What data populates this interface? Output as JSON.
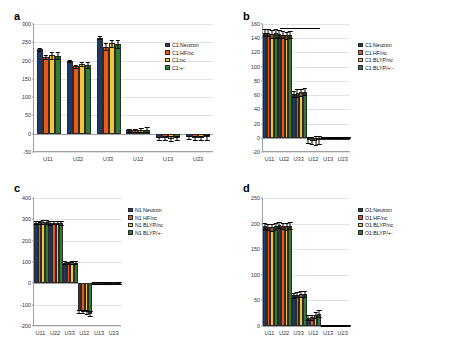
{
  "figure": {
    "background": "#ffffff",
    "series_colors": [
      "#1F3864",
      "#E8591B",
      "#F5C23A",
      "#2E7D32"
    ]
  },
  "panels": [
    {
      "letter": "a",
      "legend": [
        "C1:Neutron",
        "C1:HF/nc",
        "C1:nc",
        "C1:+-"
      ],
      "chart_data": {
        "type": "bar",
        "title": "",
        "xlabel": "",
        "ylabel": "",
        "categories": [
          "U11",
          "U22",
          "U33",
          "U12",
          "U13",
          "U23"
        ],
        "ylim": [
          -50,
          300
        ],
        "yticks": [
          -50,
          0,
          50,
          100,
          150,
          200,
          250,
          300
        ],
        "grid": true,
        "legend_position": "top-right",
        "series": [
          {
            "name": "C1:Neutron",
            "color": "#1F3864",
            "values": [
              231,
              199,
              263,
              9,
              -12,
              -10
            ],
            "errors": [
              4,
              3,
              4,
              3,
              4,
              4
            ]
          },
          {
            "name": "C1:HF/nc",
            "color": "#E8591B",
            "values": [
              210,
              184,
              238,
              10,
              -12,
              -11
            ],
            "errors": [
              5,
              4,
              9,
              4,
              5,
              5
            ]
          },
          {
            "name": "C1:nc",
            "color": "#F5C23A",
            "values": [
              214,
              190,
              247,
              10,
              -14,
              -12
            ],
            "errors": [
              10,
              6,
              10,
              6,
              7,
              6
            ]
          },
          {
            "name": "C1:+-",
            "color": "#2E7D32",
            "values": [
              213,
              188,
              245,
              11,
              -11,
              -10
            ],
            "errors": [
              10,
              7,
              10,
              7,
              6,
              6
            ]
          }
        ]
      }
    },
    {
      "letter": "b",
      "legend": [
        "C1:Neutron",
        "C1:HF/nc",
        "C1:BLYP/nc",
        "C1:BLYP/+ -"
      ],
      "annotation_bar": true,
      "chart_data": {
        "type": "bar",
        "title": "",
        "xlabel": "",
        "ylabel": "",
        "categories": [
          "U11",
          "U22",
          "U33",
          "U12",
          "U13",
          "U23"
        ],
        "ylim": [
          -20,
          160
        ],
        "yticks": [
          -20,
          0,
          20,
          40,
          60,
          80,
          100,
          120,
          140,
          160
        ],
        "grid": true,
        "legend_position": "right",
        "series": [
          {
            "name": "C1:Neutron",
            "color": "#1F3864",
            "values": [
              148,
              146,
              62,
              -3,
              0,
              0
            ],
            "errors": [
              5,
              5,
              4,
              4,
              1,
              1
            ]
          },
          {
            "name": "C1:HF/nc",
            "color": "#E8591B",
            "values": [
              148,
              145,
              63,
              -4,
              0,
              0
            ],
            "errors": [
              5,
              5,
              5,
              5,
              1,
              1
            ]
          },
          {
            "name": "C1:BLYP/nc",
            "color": "#F5C23A",
            "values": [
              146,
              144,
              64,
              -4,
              0,
              0
            ],
            "errors": [
              6,
              5,
              5,
              6,
              1,
              1
            ]
          },
          {
            "name": "C1:BLYP/+ -",
            "color": "#2E7D32",
            "values": [
              147,
              145,
              65,
              -3,
              0,
              0
            ],
            "errors": [
              6,
              5,
              5,
              6,
              1,
              1
            ]
          }
        ]
      }
    },
    {
      "letter": "c",
      "legend": [
        "N1 Neutron",
        "N1 HF/nc",
        "N1 BLYP/nc",
        "N1 BLYP/+-"
      ],
      "chart_data": {
        "type": "bar",
        "title": "",
        "xlabel": "",
        "ylabel": "",
        "categories": [
          "U11",
          "U22",
          "U33",
          "U12",
          "U13",
          "U23"
        ],
        "ylim": [
          -200,
          400
        ],
        "yticks": [
          -200,
          -100,
          0,
          100,
          200,
          300,
          400
        ],
        "grid": true,
        "legend_position": "right",
        "series": [
          {
            "name": "N1 Neutron",
            "color": "#1F3864",
            "values": [
              285,
              283,
              97,
              -132,
              2,
              2
            ],
            "errors": [
              8,
              8,
              6,
              8,
              3,
              3
            ]
          },
          {
            "name": "N1 HF/nc",
            "color": "#E8591B",
            "values": [
              286,
              284,
              96,
              -133,
              2,
              2
            ],
            "errors": [
              8,
              8,
              6,
              8,
              3,
              3
            ]
          },
          {
            "name": "N1 BLYP/nc",
            "color": "#F5C23A",
            "values": [
              287,
              285,
              98,
              -134,
              2,
              2
            ],
            "errors": [
              9,
              8,
              7,
              9,
              3,
              3
            ]
          },
          {
            "name": "N1 BLYP/+-",
            "color": "#2E7D32",
            "values": [
              286,
              284,
              97,
              -142,
              2,
              2
            ],
            "errors": [
              9,
              9,
              7,
              10,
              3,
              3
            ]
          }
        ]
      }
    },
    {
      "letter": "d",
      "legend": [
        "O1:Neutron",
        "O1:HF/nc",
        "O1:BLYP/nc",
        "O1:BLYP/+-"
      ],
      "chart_data": {
        "type": "bar",
        "title": "",
        "xlabel": "",
        "ylabel": "",
        "categories": [
          "U11",
          "U22",
          "U33",
          "U12",
          "U13",
          "U23"
        ],
        "ylim": [
          0,
          250
        ],
        "yticks": [
          0,
          50,
          100,
          150,
          200,
          250
        ],
        "grid": true,
        "legend_position": "right",
        "series": [
          {
            "name": "O1:Neutron",
            "color": "#1F3864",
            "values": [
              196,
              197,
              60,
              16,
              1,
              1
            ],
            "errors": [
              6,
              6,
              5,
              5,
              1,
              1
            ]
          },
          {
            "name": "O1:HF/nc",
            "color": "#E8591B",
            "values": [
              194,
              196,
              61,
              17,
              1,
              1
            ],
            "errors": [
              6,
              6,
              5,
              5,
              1,
              1
            ]
          },
          {
            "name": "O1:BLYP/nc",
            "color": "#F5C23A",
            "values": [
              193,
              195,
              62,
              21,
              1,
              1
            ],
            "errors": [
              7,
              7,
              6,
              6,
              1,
              1
            ]
          },
          {
            "name": "O1:BLYP/+-",
            "color": "#2E7D32",
            "values": [
              195,
              196,
              63,
              24,
              1,
              1
            ],
            "errors": [
              7,
              7,
              6,
              7,
              1,
              1
            ]
          }
        ]
      }
    }
  ]
}
